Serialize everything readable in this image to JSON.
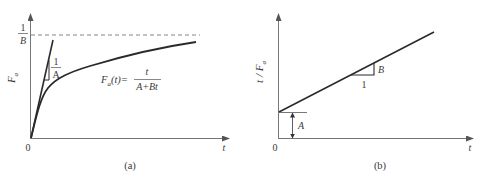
{
  "panel_a": {
    "caption": "(a)",
    "y_axis_label": "F",
    "y_axis_subscript": "a",
    "x_axis_label": "t",
    "origin_label": "0",
    "asymptote_numerator": "1",
    "asymptote_denominator": "B",
    "slope_numerator": "1",
    "slope_denominator": "A",
    "formula_lhs_main": "F",
    "formula_lhs_sub": "a",
    "formula_lhs_arg": "(t)=",
    "formula_numerator": "t",
    "formula_denominator": "A+Bt"
  },
  "panel_b": {
    "caption": "(b)",
    "y_axis_label": "t / F",
    "y_axis_subscript": "a",
    "x_axis_label": "t",
    "origin_label": "0",
    "slope_rise_label": "B",
    "slope_run_label": "1",
    "intercept_label": "A"
  },
  "colors": {
    "line": "#2a2a2a",
    "axis": "#555555",
    "text": "#3a3a3a"
  }
}
